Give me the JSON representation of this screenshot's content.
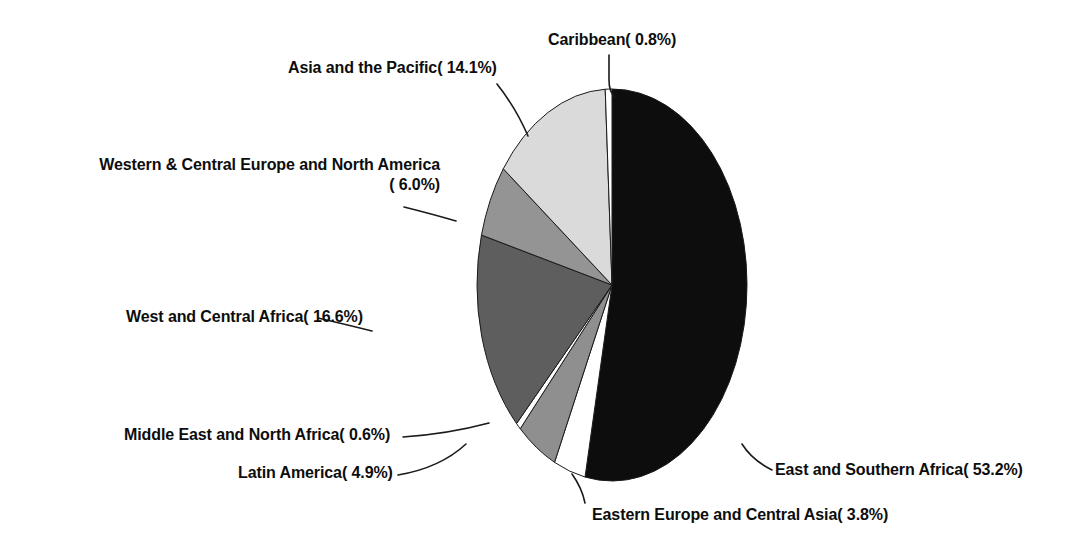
{
  "chart_data": {
    "type": "pie",
    "title": "",
    "subtitle": "",
    "xlabel": "",
    "ylabel": "",
    "legend_position": "none",
    "grid": false,
    "value_unit": "percent",
    "categories": [
      "East and Southern Africa",
      "Eastern Europe and Central Asia",
      "Latin America",
      "Middle East and North Africa",
      "West and Central Africa",
      "Western & Central Europe and North America",
      "Asia and the Pacific",
      "Caribbean"
    ],
    "values": [
      53.2,
      3.8,
      4.9,
      0.6,
      16.6,
      6.0,
      14.1,
      0.8
    ],
    "slices": [
      {
        "name": "East and Southern Africa",
        "value": 53.2,
        "label": "East and Southern Africa( 53.2%)",
        "color": "#0d0d0d",
        "start_angle_deg": 0.0,
        "end_angle_deg": 191.52
      },
      {
        "name": "Eastern Europe and Central Asia",
        "value": 3.8,
        "label": "Eastern Europe and Central Asia( 3.8%)",
        "color": "#ffffff",
        "start_angle_deg": 191.52,
        "end_angle_deg": 205.2
      },
      {
        "name": "Latin America",
        "value": 4.9,
        "label": "Latin America( 4.9%)",
        "color": "#8f8f8f",
        "start_angle_deg": 205.2,
        "end_angle_deg": 222.84
      },
      {
        "name": "Middle East and North Africa",
        "value": 0.6,
        "label": "Middle East and North Africa( 0.6%)",
        "color": "#ffffff",
        "start_angle_deg": 222.84,
        "end_angle_deg": 225.0
      },
      {
        "name": "West and Central Africa",
        "value": 16.6,
        "label": "West and Central Africa( 16.6%)",
        "color": "#5e5e5e",
        "start_angle_deg": 225.0,
        "end_angle_deg": 284.76
      },
      {
        "name": "Western & Central Europe and North America",
        "value": 6.0,
        "label_line1": "Western & Central Europe and North America",
        "label_line2": "( 6.0%)",
        "color": "#949494",
        "start_angle_deg": 284.76,
        "end_angle_deg": 306.36
      },
      {
        "name": "Asia and the Pacific",
        "value": 14.1,
        "label": "Asia and the Pacific( 14.1%)",
        "color": "#dadada",
        "start_angle_deg": 306.36,
        "end_angle_deg": 357.12
      },
      {
        "name": "Caribbean",
        "value": 0.8,
        "label": "Caribbean( 0.8%)",
        "color": "#ffffff",
        "start_angle_deg": 357.12,
        "end_angle_deg": 360.0
      }
    ]
  },
  "labels": {
    "caribbean": "Caribbean( 0.8%)",
    "asia_pacific": "Asia and the Pacific( 14.1%)",
    "wce_na_line1": "Western & Central Europe and North America",
    "wce_na_line2": "( 6.0%)",
    "wc_africa": "West and Central Africa( 16.6%)",
    "mena": "Middle East and North Africa( 0.6%)",
    "latin_america": "Latin America( 4.9%)",
    "eee_ca": "Eastern Europe and Central Asia( 3.8%)",
    "esa": "East and Southern Africa( 53.2%)"
  },
  "colors": {
    "background": "#ffffff",
    "outline": "#1a1a1a",
    "text": "#0d0d0d",
    "slice_black": "#0d0d0d",
    "slice_dark_gray": "#5e5e5e",
    "slice_mid_gray": "#8f8f8f",
    "slice_gray": "#949494",
    "slice_light_gray": "#dadada",
    "slice_white": "#ffffff"
  }
}
